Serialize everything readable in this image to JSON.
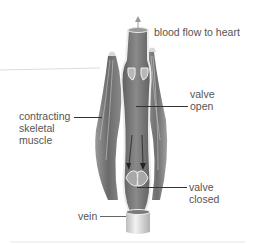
{
  "diagram": {
    "labels": {
      "blood_flow": "blood flow to heart",
      "contracting_line1": "contracting",
      "contracting_line2": "skeletal",
      "contracting_line3": "muscle",
      "valve_open_line1": "valve",
      "valve_open_line2": "open",
      "valve_closed_line1": "valve",
      "valve_closed_line2": "closed",
      "vein": "vein"
    },
    "colors": {
      "muscle_dark": "#6e6e6e",
      "muscle_light": "#b5b5b5",
      "vein_wall": "#e8e8e8",
      "vein_interior": "#7a7a7a",
      "label_text": "#555555",
      "leader_line": "#333333"
    }
  }
}
